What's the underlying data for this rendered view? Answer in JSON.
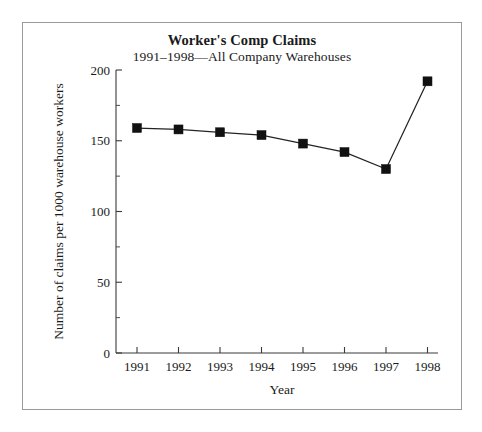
{
  "chart_data": {
    "type": "line",
    "title": "Worker's Comp Claims",
    "subtitle": "1991–1998—All Company Warehouses",
    "xlabel": "Year",
    "ylabel": "Number of claims per 1000 warehouse workers",
    "categories": [
      "1991",
      "1992",
      "1993",
      "1994",
      "1995",
      "1996",
      "1997",
      "1998"
    ],
    "values": [
      159,
      158,
      156,
      154,
      148,
      142,
      130,
      192
    ],
    "x": [
      1991,
      1992,
      1993,
      1994,
      1995,
      1996,
      1997,
      1998
    ],
    "series": [
      {
        "name": "Claims per 1000 warehouse workers",
        "values": [
          159,
          158,
          156,
          154,
          148,
          142,
          130,
          192
        ]
      }
    ],
    "ylim": [
      0,
      200
    ],
    "y_ticks_major": [
      0,
      50,
      100,
      150,
      200
    ],
    "y_tick_labels": [
      "0",
      "50",
      "100",
      "150",
      "200"
    ],
    "y_ticks_minor": [
      25,
      75,
      125,
      175
    ],
    "x_tick_labels": [
      "1991",
      "1992",
      "1993",
      "1994",
      "1995",
      "1996",
      "1997",
      "1998"
    ],
    "grid": false,
    "legend": "none",
    "marker": "square",
    "line_color": "#232323",
    "marker_color": "#111111",
    "axis_color": "#3a3a3a",
    "background": "#ffffff",
    "border_color": "#9a9a9a"
  }
}
